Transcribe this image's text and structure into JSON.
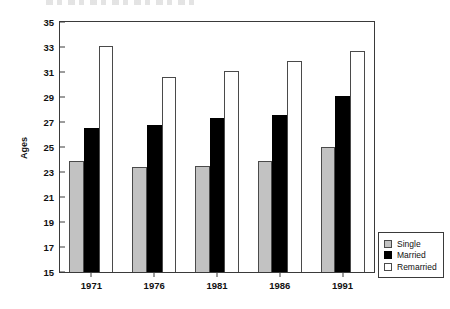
{
  "chart_data": {
    "type": "bar",
    "title": "",
    "xlabel": "",
    "ylabel": "Ages",
    "ylim": [
      15,
      35
    ],
    "ytick_step": 2,
    "yticks": [
      35,
      33,
      31,
      29,
      27,
      25,
      23,
      21,
      19,
      17,
      15
    ],
    "grid": false,
    "legend_position": "bottom-right",
    "categories": [
      "1971",
      "1976",
      "1981",
      "1986",
      "1991"
    ],
    "series": [
      {
        "name": "Single",
        "color": "#c2c2c2",
        "values": [
          23.9,
          23.4,
          23.5,
          23.9,
          25.0
        ]
      },
      {
        "name": "Married",
        "color": "#000000",
        "values": [
          26.5,
          26.8,
          27.3,
          27.6,
          29.1
        ]
      },
      {
        "name": "Remarried",
        "color": "#ffffff",
        "values": [
          33.1,
          30.6,
          31.1,
          31.9,
          32.7
        ]
      }
    ]
  },
  "legend": {
    "items": [
      {
        "label": "Single"
      },
      {
        "label": "Married"
      },
      {
        "label": "Remarried"
      }
    ]
  },
  "axis": {
    "y_title": "Ages"
  },
  "colors": {
    "single": "#c2c2c2",
    "married": "#000000",
    "remarried": "#ffffff",
    "axis": "#3a3a3a",
    "text": "#111111",
    "background": "#ffffff"
  }
}
